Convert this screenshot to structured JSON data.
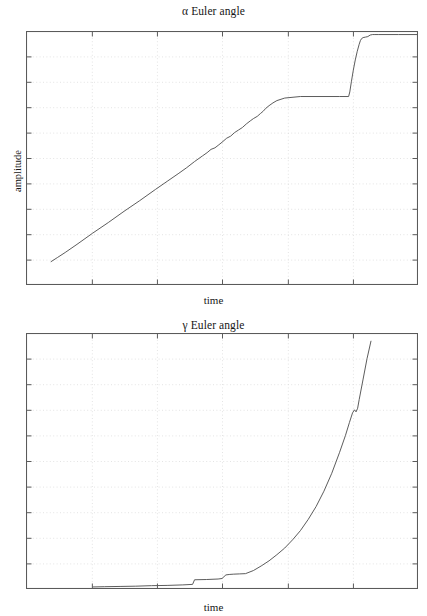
{
  "figure": {
    "background": "#ffffff",
    "line_color": "#4a4a4a",
    "frame_color": "#5a5a5a",
    "grid_color": "#d8d8d8"
  },
  "panels": [
    {
      "key": "alpha",
      "title": "α Euler angle",
      "xlabel": "time",
      "ylabel": "amplitude"
    },
    {
      "key": "gamma",
      "title": "γ Euler angle",
      "xlabel": "time",
      "ylabel": "amplitude"
    }
  ],
  "chart_data": [
    {
      "type": "line",
      "title": "α Euler angle",
      "xlabel": "time",
      "ylabel": "amplitude",
      "xlim": [
        0,
        1
      ],
      "ylim": [
        0,
        1
      ],
      "grid": true,
      "grid_style": "dotted",
      "xticks": [
        0.168,
        0.334,
        0.5,
        0.668,
        0.834
      ],
      "yticks": [
        0.1,
        0.2,
        0.3,
        0.4,
        0.5,
        0.6,
        0.7,
        0.8,
        0.9
      ],
      "legend": null,
      "series": [
        {
          "name": "alpha",
          "x": [
            0.064,
            0.08,
            0.1,
            0.13,
            0.17,
            0.21,
            0.25,
            0.29,
            0.33,
            0.36,
            0.39,
            0.41,
            0.43,
            0.45,
            0.462,
            0.472,
            0.482,
            0.492,
            0.5,
            0.512,
            0.522,
            0.532,
            0.542,
            0.552,
            0.562,
            0.572,
            0.58,
            0.59,
            0.598,
            0.605,
            0.612,
            0.62,
            0.63,
            0.64,
            0.66,
            0.7,
            0.75,
            0.8,
            0.823,
            0.826,
            0.83,
            0.835,
            0.84,
            0.845,
            0.85,
            0.853,
            0.856,
            0.86,
            0.866,
            0.872,
            0.878,
            0.884,
            0.89,
            0.9,
            0.95,
            1.0
          ],
          "y": [
            0.092,
            0.108,
            0.128,
            0.16,
            0.204,
            0.246,
            0.29,
            0.332,
            0.376,
            0.408,
            0.44,
            0.462,
            0.486,
            0.508,
            0.521,
            0.534,
            0.54,
            0.552,
            0.562,
            0.578,
            0.586,
            0.6,
            0.61,
            0.62,
            0.634,
            0.646,
            0.655,
            0.664,
            0.675,
            0.684,
            0.696,
            0.706,
            0.717,
            0.726,
            0.736,
            0.742,
            0.742,
            0.742,
            0.742,
            0.76,
            0.8,
            0.846,
            0.886,
            0.92,
            0.948,
            0.962,
            0.97,
            0.974,
            0.976,
            0.978,
            0.984,
            0.986,
            0.986,
            0.986,
            0.986,
            0.986
          ]
        }
      ]
    },
    {
      "type": "line",
      "title": "γ Euler angle",
      "xlabel": "time",
      "ylabel": "amplitude",
      "xlim": [
        0,
        1
      ],
      "ylim": [
        0,
        1
      ],
      "grid": true,
      "grid_style": "dotted",
      "xticks": [
        0.168,
        0.334,
        0.5,
        0.668,
        0.834
      ],
      "yticks": [
        0.1,
        0.2,
        0.3,
        0.4,
        0.5,
        0.6,
        0.7,
        0.8,
        0.9
      ],
      "legend": null,
      "series": [
        {
          "name": "gamma",
          "x": [
            0.17,
            0.2,
            0.24,
            0.28,
            0.32,
            0.36,
            0.4,
            0.425,
            0.43,
            0.46,
            0.49,
            0.5,
            0.51,
            0.52,
            0.53,
            0.545,
            0.56,
            0.58,
            0.6,
            0.62,
            0.64,
            0.66,
            0.68,
            0.7,
            0.72,
            0.74,
            0.76,
            0.78,
            0.8,
            0.815,
            0.825,
            0.833,
            0.838,
            0.842,
            0.846,
            0.85,
            0.86,
            0.87,
            0.88
          ],
          "y": [
            0.008,
            0.009,
            0.01,
            0.011,
            0.013,
            0.014,
            0.016,
            0.018,
            0.036,
            0.037,
            0.039,
            0.041,
            0.055,
            0.057,
            0.058,
            0.059,
            0.06,
            0.072,
            0.09,
            0.11,
            0.134,
            0.16,
            0.192,
            0.228,
            0.272,
            0.322,
            0.382,
            0.452,
            0.534,
            0.6,
            0.65,
            0.688,
            0.7,
            0.692,
            0.706,
            0.74,
            0.82,
            0.9,
            0.968
          ]
        }
      ]
    }
  ]
}
